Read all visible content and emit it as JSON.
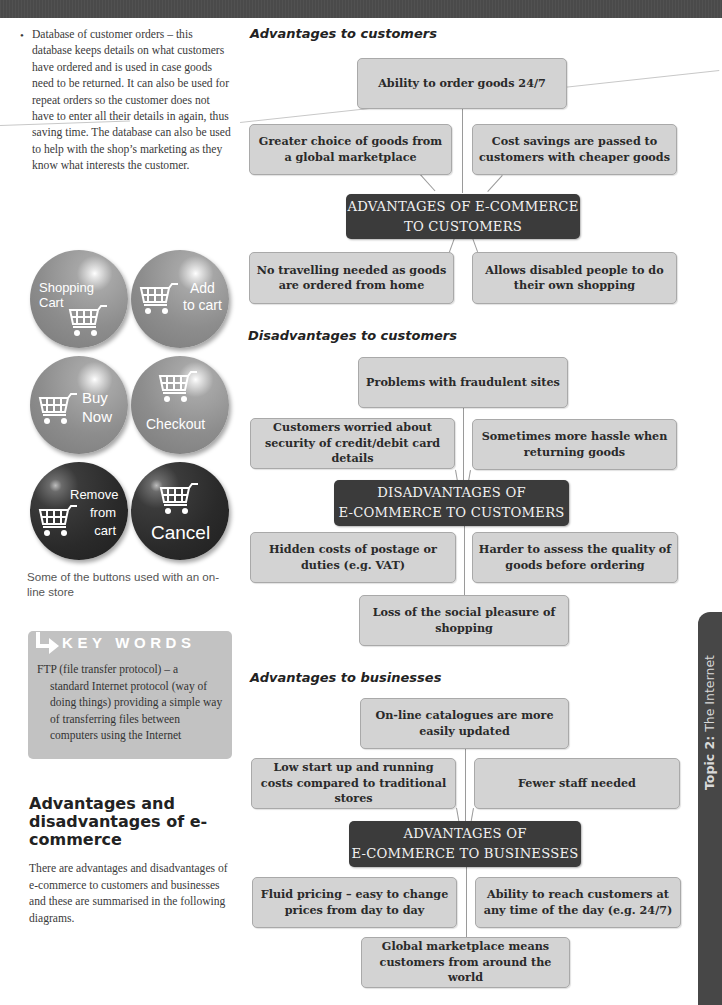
{
  "left_column": {
    "bullet_text": "Database of customer orders – this database keeps details on what customers have ordered and is used in case goods need to be returned. It can also be used for repeat orders so the customer does not have to enter all their details in again, thus saving time. The database can also be used to help with the shop’s marketing as they know what interests the customer.",
    "buttons": [
      {
        "label_line1": "Shopping",
        "label_line2": "Cart",
        "style": "light"
      },
      {
        "label_line1": "Add",
        "label_line2": "to cart",
        "style": "light"
      },
      {
        "label_line1": "Buy",
        "label_line2": "Now",
        "style": "light"
      },
      {
        "label_line1": "Checkout",
        "label_line2": "",
        "style": "light"
      },
      {
        "label_line1": "Remove",
        "label_line2": "from",
        "label_line3": "cart",
        "style": "dark"
      },
      {
        "label_line1": "Cancel",
        "label_line2": "",
        "style": "dark"
      }
    ],
    "buttons_caption": "Some of the buttons used with an on-line store",
    "key_words": {
      "title": "KEY WORDS",
      "term_line": "FTP (file transfer protocol) – a",
      "definition": "standard Internet protocol (way of doing things) providing a simple way of transferring files between computers using the Internet"
    },
    "section_title": "Advantages and disadvantages of e-commerce",
    "section_body": "There are advantages and disadvantages of e-commerce to customers and businesses and these are summarised in the following diagrams."
  },
  "diagrams": {
    "adv_customers": {
      "heading": "Advantages to customers",
      "hub_line1": "ADVANTAGES OF E-COMMERCE",
      "hub_line2": "TO CUSTOMERS",
      "top": "Ability to order goods 24/7",
      "upper_left": "Greater choice of goods from a global marketplace",
      "upper_right": "Cost savings are passed to customers with cheaper goods",
      "lower_left": "No travelling needed as goods are ordered from home",
      "lower_right": "Allows disabled people to do their own shopping"
    },
    "disadv_customers": {
      "heading": "Disadvantages to customers",
      "hub_line1": "DISADVANTAGES OF",
      "hub_line2": "E-COMMERCE TO CUSTOMERS",
      "top": "Problems with fraudulent sites",
      "upper_left": "Customers worried about security of credit/debit card details",
      "upper_right": "Sometimes more hassle when returning goods",
      "lower_left": "Hidden costs of postage or duties (e.g. VAT)",
      "lower_right": "Harder to assess the quality of goods before ordering",
      "bottom": "Loss of the social pleasure of shopping"
    },
    "adv_businesses": {
      "heading": "Advantages to businesses",
      "hub_line1": "ADVANTAGES OF",
      "hub_line2": "E-COMMERCE TO BUSINESSES",
      "top": "On-line catalogues are more easily updated",
      "upper_left": "Low start up and running costs compared to traditional stores",
      "upper_right": "Fewer staff needed",
      "lower_left": "Fluid pricing – easy to change prices from day to day",
      "lower_right": "Ability to reach customers at any time of the day (e.g. 24/7)",
      "bottom": "Global marketplace means customers from around the world"
    }
  },
  "side_tab": {
    "bold": "Topic 2:",
    "text": " The Internet"
  }
}
